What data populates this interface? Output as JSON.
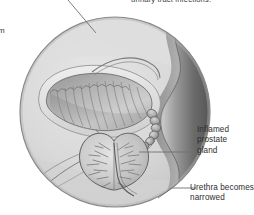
{
  "figure": {
    "name": "prostate-cross-section-illustration",
    "background_color": "#ffffff",
    "inset": {
      "shape": "circle",
      "center_x": 115,
      "center_y": 112,
      "radius": 95,
      "fill_color": "#d8d8d8",
      "border_color": "#8a8a8a"
    },
    "palette": {
      "tissue_light": "#e2e2e2",
      "tissue_mid": "#c4c4c4",
      "tissue_dark": "#8d8d8d",
      "organ_shadow": "#6e6e6e",
      "outline": "#5a5a5a",
      "text": "#2e2e2e",
      "leader_line": "#6f6f6f"
    },
    "structures": [
      {
        "name": "bladder",
        "label": "bladder with trabeculated ridged wall"
      },
      {
        "name": "seminal-vesicle",
        "label": "beaded seminal vesicle chain"
      },
      {
        "name": "prostate-gland",
        "label": "enlarged heart-shaped prostate gland with radiating ducts"
      },
      {
        "name": "vas-deferens",
        "label": "vas deferens tubes"
      },
      {
        "name": "rectal-wall",
        "label": "dark wavy rectal wall band"
      },
      {
        "name": "urethra",
        "label": "narrowed urethra"
      }
    ]
  },
  "clipped_text": {
    "top": "urinary tract infections.",
    "left": "m"
  },
  "callouts": [
    {
      "name": "inflamed-prostate-gland",
      "lines": [
        "Inflamed",
        "prostate",
        "gland"
      ],
      "leader": "horizontal line from prostate to label"
    },
    {
      "name": "urethra-becomes-narrowed",
      "lines": [
        "Urethra becomes",
        "narrowed"
      ],
      "leader": "diagonal line from urethra up to label"
    }
  ]
}
